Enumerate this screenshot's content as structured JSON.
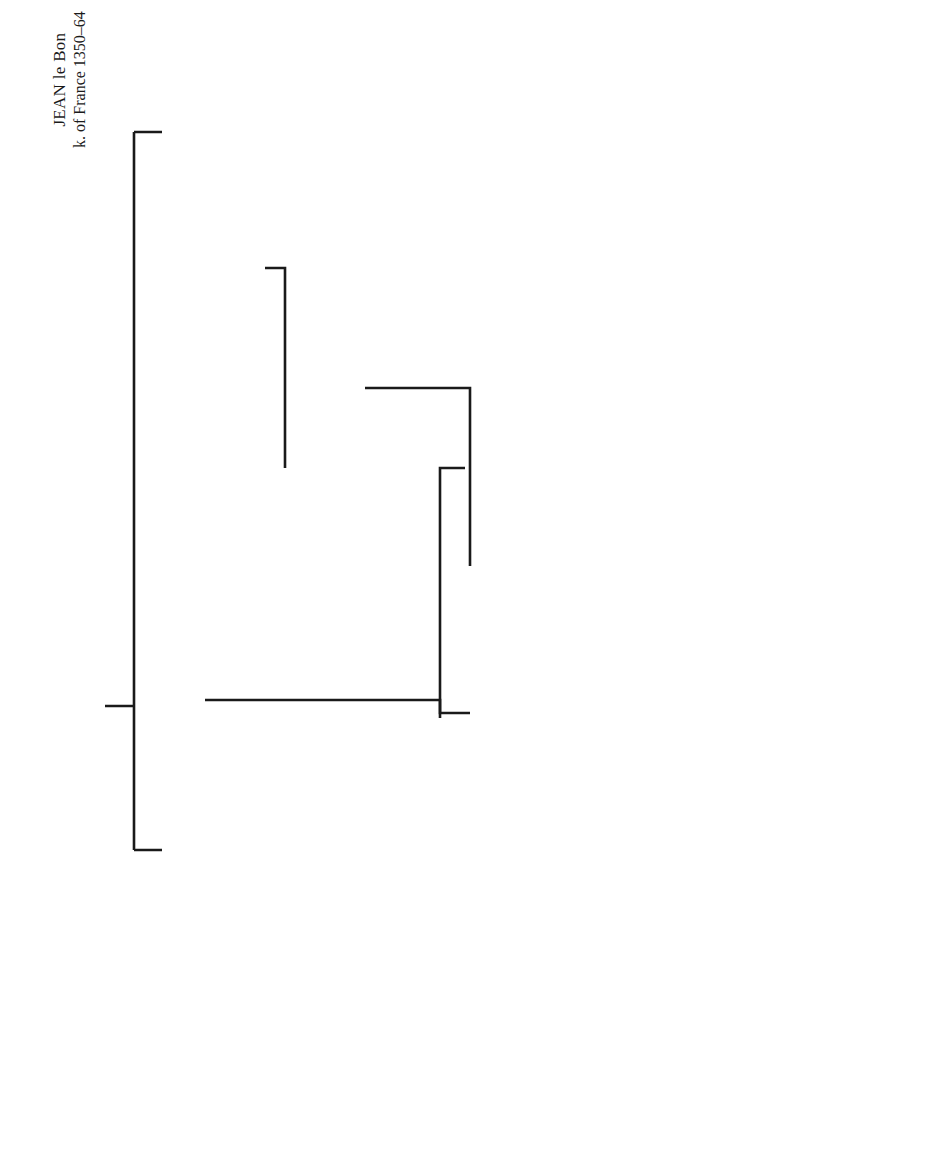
{
  "diagram": {
    "type": "family-tree",
    "orientation": "rotated-90-ccw",
    "persons": {
      "jean_le_bon": {
        "name": "JEAN le Bon",
        "detail": "k. of France 1350–64"
      },
      "bonne": {
        "name": "BONNE d. of JEAN the Blind",
        "detail": "duke of Luxembourg & k. of Bohemia."
      },
      "louis_i": {
        "name": "LOUIS I",
        "detail1": "duke of Anjou, titular",
        "detail2": "k. of Naples, Sicily & Jerusalem",
        "detail3": "† 1384"
      },
      "marie_blois": {
        "name": "MARIE d. of",
        "detail1": "CHARLES de Châtillon,",
        "detail2": "cte. of Blois † 1404"
      },
      "marie": {
        "name": "MARIE",
        "detail": "† 1404"
      },
      "robert_i": {
        "name": "ROBERT I",
        "detail": "duke of Bar † 1411"
      },
      "yolande_bar": {
        "name": "YOLANDE"
      },
      "juan_i": {
        "name": "JUAN I k. of Aragon,",
        "detail": "Catalonia & Valencia † 1395"
      },
      "louis_ii": {
        "name": "LOUIS II",
        "detail": "† 1417"
      },
      "yolande_aragon": {
        "name": "YOLANDE",
        "detail": "† 1443/4"
      },
      "charles_bold": {
        "name": "CHARLES the Bold",
        "detail": "duke of Lorraine"
      },
      "isabelle": {
        "name": "ISABELLE",
        "detail": "† 1453"
      },
      "rene_i": {
        "name": "RENÉ I",
        "detail": "(1408–1480)"
      },
      "jehanne": {
        "name": "JEHANNE d. of",
        "detail": "GUI III cte. of Laval"
      },
      "yolande_lorraine": {
        "name": "YOLANDE",
        "detail": "† 1483"
      },
      "ferri_ii": {
        "name": "FERRI II",
        "detail": "cte. of Vaudemont"
      },
      "rene_ii": {
        "name": "RENÉ II"
      },
      "marguerite": {
        "name": "MARGUERITE"
      },
      "henry_vi": {
        "name": "HENRY VI",
        "detail": "k. of England"
      }
    },
    "symbols": {
      "marriage": "=",
      "continuation_arrow": "→"
    },
    "marriages": [
      [
        "JEAN le Bon",
        "BONNE"
      ],
      [
        "LOUIS I",
        "MARIE d. of CHARLES de Châtillon"
      ],
      [
        "MARIE",
        "ROBERT I"
      ],
      [
        "YOLANDE",
        "JUAN I"
      ],
      [
        "LOUIS II",
        "YOLANDE"
      ],
      [
        "ISABELLE",
        "RENÉ I"
      ],
      [
        "RENÉ I",
        "JEHANNE"
      ],
      [
        "YOLANDE",
        "FERRI II"
      ],
      [
        "MARGUERITE",
        "HENRY VI"
      ]
    ]
  }
}
